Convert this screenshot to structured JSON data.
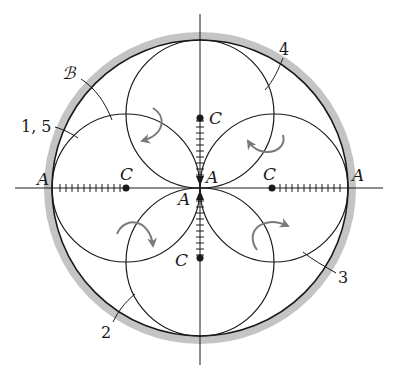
{
  "figure": {
    "colors": {
      "line": "#1a1a1a",
      "boundary_band": "#bdbdbd",
      "arrow": "#7a7a7a",
      "background": "#ffffff"
    },
    "labels": {
      "A_left": "A",
      "A_right": "A",
      "A_center_upper": "A",
      "A_center_lower": "A",
      "C_left": "C",
      "C_right": "C",
      "C_top": "C",
      "C_bottom": "C",
      "B": "ℬ",
      "pos_1_5": "1, 5",
      "pos_2": "2",
      "pos_3": "3",
      "pos_4": "4"
    },
    "geometry": {
      "center": [
        200,
        188
      ],
      "outer_radius": 148,
      "band_width": 8,
      "inner_radius": 74,
      "inner_circle_centers": [
        [
          126,
          188
        ],
        [
          274,
          188
        ],
        [
          200,
          114
        ],
        [
          200,
          262
        ]
      ]
    }
  }
}
